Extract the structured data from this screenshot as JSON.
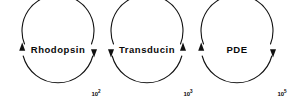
{
  "figure": {
    "background_color": "#ffffff",
    "stroke_color": "#111111",
    "text_color": "#0a0a0a",
    "width": 300,
    "height": 106
  },
  "cycles": [
    {
      "id": "rhodopsin",
      "label": "Rhodopsin",
      "cx": 58,
      "cy": 50,
      "r": 36,
      "left_arrow": "up",
      "right_arrow": "down"
    },
    {
      "id": "transducin",
      "label": "Transducin",
      "cx": 147,
      "cy": 50,
      "r": 36,
      "left_arrow": "down",
      "right_arrow": "up"
    },
    {
      "id": "pde",
      "label": "PDE",
      "cx": 237,
      "cy": 50,
      "r": 36,
      "left_arrow": "up",
      "right_arrow": "down"
    }
  ],
  "gain_labels": [
    {
      "id": "gain-1",
      "base": "10",
      "exponent": "2",
      "x": 96,
      "y": 94
    },
    {
      "id": "gain-2",
      "base": "10",
      "exponent": "3",
      "x": 188,
      "y": 94
    },
    {
      "id": "gain-3",
      "base": "10",
      "exponent": "5",
      "x": 282,
      "y": 94
    }
  ]
}
